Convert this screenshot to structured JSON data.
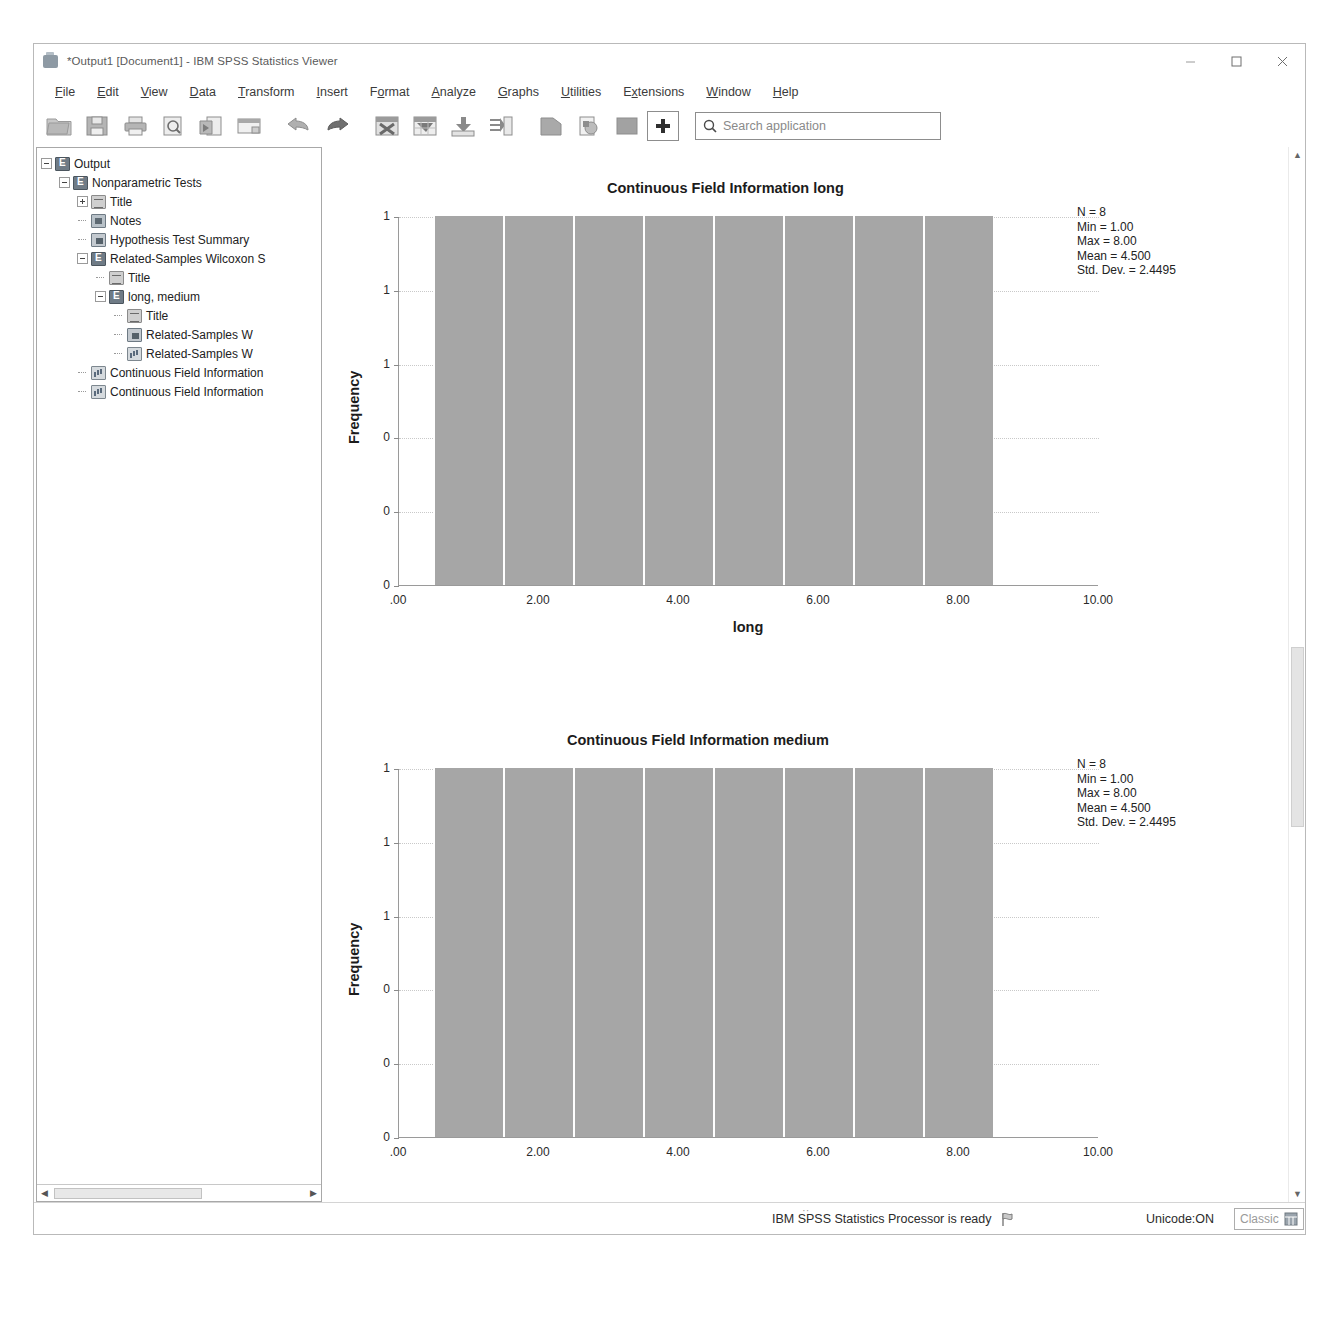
{
  "window": {
    "title": "*Output1 [Document1] - IBM SPSS Statistics Viewer",
    "icon": "spss-viewer-icon",
    "minimize": "minimize-icon",
    "maximize": "maximize-icon",
    "close": "close-icon"
  },
  "menu": [
    {
      "label": "File",
      "accel": "F"
    },
    {
      "label": "Edit",
      "accel": "E"
    },
    {
      "label": "View",
      "accel": "V"
    },
    {
      "label": "Data",
      "accel": "D"
    },
    {
      "label": "Transform",
      "accel": "T"
    },
    {
      "label": "Insert",
      "accel": "I"
    },
    {
      "label": "Format",
      "accel": "o"
    },
    {
      "label": "Analyze",
      "accel": "A"
    },
    {
      "label": "Graphs",
      "accel": "G"
    },
    {
      "label": "Utilities",
      "accel": "U"
    },
    {
      "label": "Extensions",
      "accel": "x"
    },
    {
      "label": "Window",
      "accel": "W"
    },
    {
      "label": "Help",
      "accel": "H"
    }
  ],
  "toolbar": {
    "buttons": [
      "open-file-icon",
      "save-icon",
      "print-icon",
      "print-preview-icon",
      "export-icon",
      "recall-dialog-icon",
      "undo-icon",
      "redo-icon",
      "go-to-case-icon",
      "go-to-variable-icon",
      "insert-cases-icon",
      "insert-variable-icon",
      "split-file-icon",
      "select-cases-icon",
      "value-labels-icon",
      "use-sets-icon"
    ],
    "search_icon": "search-icon",
    "search_placeholder": "Search application",
    "search_value": ""
  },
  "outline": {
    "nodes": [
      {
        "label": "Output",
        "indent": 0,
        "toggle": "minus",
        "icon": "output-book-icon"
      },
      {
        "label": "Nonparametric Tests",
        "indent": 1,
        "toggle": "minus",
        "icon": "output-book-icon"
      },
      {
        "label": "Title",
        "indent": 2,
        "toggle": "plus",
        "icon": "title-icon"
      },
      {
        "label": "Notes",
        "indent": 2,
        "toggle": "none",
        "icon": "notes-icon"
      },
      {
        "label": "Hypothesis Test Summary",
        "indent": 2,
        "toggle": "none",
        "icon": "table-icon"
      },
      {
        "label": "Related-Samples Wilcoxon S",
        "indent": 2,
        "toggle": "minus",
        "icon": "output-book-icon"
      },
      {
        "label": "Title",
        "indent": 3,
        "toggle": "none",
        "icon": "title-icon"
      },
      {
        "label": "long, medium",
        "indent": 3,
        "toggle": "minus",
        "icon": "output-book-icon"
      },
      {
        "label": "Title",
        "indent": 4,
        "toggle": "none",
        "icon": "title-icon"
      },
      {
        "label": "Related-Samples W",
        "indent": 4,
        "toggle": "none",
        "icon": "table-icon"
      },
      {
        "label": "Related-Samples W",
        "indent": 4,
        "toggle": "none",
        "icon": "chart-icon"
      },
      {
        "label": "Continuous Field Information",
        "indent": 2,
        "toggle": "none",
        "icon": "chart-icon"
      },
      {
        "label": "Continuous Field Information",
        "indent": 2,
        "toggle": "none",
        "icon": "chart-icon"
      }
    ],
    "hscroll_left_arrow": "scroll-left-icon",
    "hscroll_right_arrow": "scroll-right-icon"
  },
  "viewer": {
    "scroll_up_icon": "scroll-up-icon",
    "scroll_down_icon": "scroll-down-icon"
  },
  "chart_data": [
    {
      "type": "bar",
      "title": "Continuous Field Information long",
      "xlabel": "long",
      "ylabel": "Frequency",
      "categories": [
        "1",
        "2",
        "3",
        "4",
        "5",
        "6",
        "7",
        "8"
      ],
      "x": [
        1,
        2,
        3,
        4,
        5,
        6,
        7,
        8
      ],
      "values": [
        1,
        1,
        1,
        1,
        1,
        1,
        1,
        1
      ],
      "xticklabels": [
        ".00",
        "2.00",
        "4.00",
        "6.00",
        "8.00",
        "10.00"
      ],
      "xtickvalues": [
        0,
        2,
        4,
        6,
        8,
        10
      ],
      "yticklabels": [
        "1",
        "1",
        "1",
        "0",
        "0",
        "0"
      ],
      "ytickvalues": [
        1.0,
        0.8,
        0.6,
        0.4,
        0.2,
        0.0
      ],
      "xlim": [
        0,
        10
      ],
      "ylim": [
        0,
        1
      ],
      "grid": true,
      "bar_color": "#a6a6a6",
      "annotations": {
        "N": "N = 8",
        "Min": "Min = 1.00",
        "Max": "Max = 8.00",
        "Mean": "Mean = 4.500",
        "StdDev": "Std. Dev. = 2.4495"
      }
    },
    {
      "type": "bar",
      "title": "Continuous Field Information medium",
      "xlabel": "medium",
      "ylabel": "Frequency",
      "categories": [
        "1",
        "2",
        "3",
        "4",
        "5",
        "6",
        "7",
        "8"
      ],
      "x": [
        1,
        2,
        3,
        4,
        5,
        6,
        7,
        8
      ],
      "values": [
        1,
        1,
        1,
        1,
        1,
        1,
        1,
        1
      ],
      "xticklabels": [
        ".00",
        "2.00",
        "4.00",
        "6.00",
        "8.00",
        "10.00"
      ],
      "xtickvalues": [
        0,
        2,
        4,
        6,
        8,
        10
      ],
      "yticklabels": [
        "1",
        "1",
        "1",
        "0",
        "0",
        "0"
      ],
      "ytickvalues": [
        1.0,
        0.8,
        0.6,
        0.4,
        0.2,
        0.0
      ],
      "xlim": [
        0,
        10
      ],
      "ylim": [
        0,
        1
      ],
      "grid": true,
      "bar_color": "#a6a6a6",
      "annotations": {
        "N": "N = 8",
        "Min": "Min = 1.00",
        "Max": "Max = 8.00",
        "Mean": "Mean = 4.500",
        "StdDev": "Std. Dev. = 2.4495"
      }
    }
  ],
  "statusbar": {
    "message": "IBM SPSS Statistics Processor is ready",
    "flag_icon": "flag-icon",
    "unicode": "Unicode:ON",
    "mode": "Classic",
    "mode_icon": "classic-mode-icon"
  }
}
